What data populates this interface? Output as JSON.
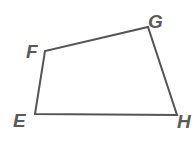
{
  "diagram": {
    "type": "quadrilateral",
    "shape_name": "EFGH",
    "stroke_color": "#555555",
    "label_color": "#5a5a5a",
    "vertices": [
      {
        "name": "E",
        "x": 35,
        "y": 114
      },
      {
        "name": "F",
        "x": 45,
        "y": 51
      },
      {
        "name": "G",
        "x": 148,
        "y": 27
      },
      {
        "name": "H",
        "x": 177,
        "y": 115
      }
    ],
    "labels": {
      "E": "E",
      "F": "F",
      "G": "G",
      "H": "H"
    },
    "sides": [
      "EF",
      "FG",
      "GH",
      "HE"
    ]
  }
}
